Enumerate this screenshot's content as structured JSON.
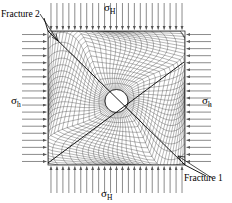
{
  "figure": {
    "name": "wellbore-fem-mesh",
    "background_color": "#ffffff",
    "line_color": "#000000"
  },
  "labels": {
    "sigma_H_top": {
      "symbol": "σ",
      "subscript": "H",
      "text": "σH"
    },
    "sigma_H_bottom": {
      "symbol": "σ",
      "subscript": "H",
      "text": "σH"
    },
    "sigma_h_left": {
      "symbol": "σ",
      "subscript": "h",
      "text": "σh"
    },
    "sigma_h_right": {
      "symbol": "σ",
      "subscript": "h",
      "text": "σh"
    },
    "fracture_1": "Fracture 1",
    "fracture_2": "Fracture 2"
  },
  "geometry": {
    "domain": {
      "x": 48,
      "y": 31,
      "width": 137,
      "height": 134
    },
    "wellbore": {
      "cx": 116.5,
      "cy": 101,
      "r": 11.5,
      "fill": "#ffffff"
    },
    "fractures": [
      {
        "name": "fracture-1",
        "x1": 48,
        "y1": 31,
        "x2": 185,
        "y2": 165,
        "leader_to": [
          213,
          181
        ]
      },
      {
        "name": "fracture-2",
        "x1": 48,
        "y1": 163,
        "x2": 184,
        "y2": 62,
        "leader_to": [
          40,
          14
        ]
      }
    ],
    "load_arrows": {
      "top": {
        "count": 23,
        "direction": "down",
        "length": 28
      },
      "bottom": {
        "count": 23,
        "direction": "up",
        "length": 28
      },
      "left": {
        "count": 19,
        "direction": "right",
        "length": 26
      },
      "right": {
        "count": 19,
        "direction": "left",
        "length": 26
      }
    },
    "mesh": {
      "radial_rings": 20,
      "circumferential_divisions": 68,
      "type": "mapped-quadrilateral-radial"
    }
  }
}
